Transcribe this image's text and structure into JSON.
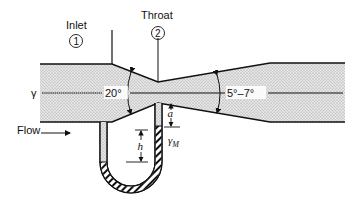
{
  "diagram": {
    "type": "venturi-meter",
    "labels": {
      "inlet": "Inlet",
      "inlet_number": "1",
      "throat": "Throat",
      "throat_number": "2",
      "fluid_weight": "γ",
      "converging_angle": "20°",
      "diverging_angle": "5°–7°",
      "flow": "Flow",
      "distance_a": "a",
      "height_h": "h",
      "manometer_fluid": "γ",
      "manometer_fluid_subscript": "M"
    },
    "colors": {
      "line": "#111111",
      "fill_stipple": "#bdbdbd",
      "background": "#ffffff"
    }
  }
}
